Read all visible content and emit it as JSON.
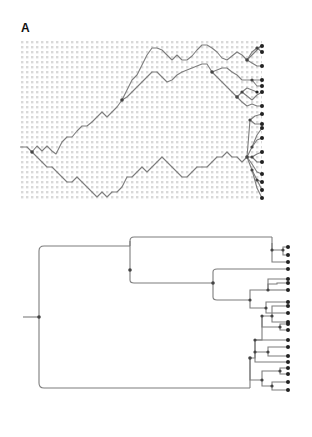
{
  "figure": {
    "panel_label": "A",
    "colors": {
      "line": "#7a7a7a",
      "node": "#333333",
      "grid_dot": "#d6d6d6",
      "background": "#ffffff"
    }
  },
  "random_walk_panel": {
    "description": "Lineages as branching random walks over a dotted grid, ending in tip nodes on the right edge",
    "grid": {
      "x0": 20,
      "y0": 40,
      "x1": 262,
      "y1": 200,
      "spacing": 5
    },
    "tip_count": 24
  },
  "tree_panel": {
    "description": "Rooted phylogenetic tree (rectangular layout) corresponding to the random-walk lineages",
    "tip_count": 24
  }
}
